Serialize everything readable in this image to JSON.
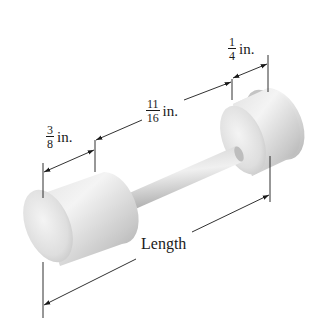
{
  "figure": {
    "colors": {
      "line": "#1a1a1a",
      "body_light": "#f2f2f2",
      "body_mid": "#d6d6d6",
      "body_dark": "#a9a9a9"
    }
  },
  "labels": {
    "left_end_width": {
      "numerator": "3",
      "denominator": "8",
      "unit": "in."
    },
    "rod_length": {
      "numerator": "11",
      "denominator": "16",
      "unit": "in."
    },
    "right_end_width": {
      "numerator": "1",
      "denominator": "4",
      "unit": "in."
    },
    "overall": {
      "text": "Length"
    }
  }
}
